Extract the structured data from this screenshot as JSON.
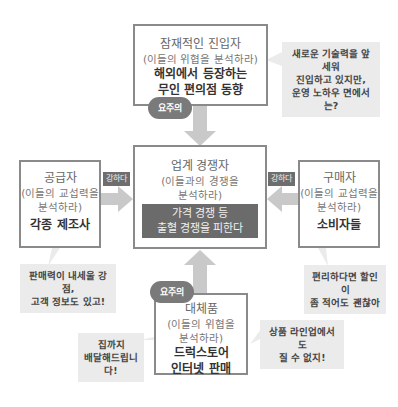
{
  "top": {
    "title": "잠재적인 진입자",
    "sub": "(이들의 위협을 분석하라)",
    "bold1": "해외에서 등장하는",
    "bold2": "무인 편의점 동향",
    "badge": "요주의",
    "bubble": [
      "새로운 기술력을 앞세워",
      "진입하고 있지만,",
      "운영 노하우 면에서는?"
    ]
  },
  "center": {
    "title": "업계 경쟁자",
    "sub1": "(이들과의 경쟁을",
    "sub2": "분석하라)",
    "dark1": "가격 경쟁 등",
    "dark2": "출혈 경쟁을 피한다"
  },
  "left": {
    "title": "공급자",
    "sub1": "(이들의 교섭력을",
    "sub2": "분석하라)",
    "bold": "각종 제조사",
    "tag": "강하다",
    "bubble": [
      "판매력이 내세울 강점,",
      "고객 정보도 있고!"
    ]
  },
  "right": {
    "title": "구매자",
    "sub1": "(이들의 교섭력을",
    "sub2": "분석하라)",
    "bold": "소비자들",
    "tag": "강하다",
    "bubble": [
      "편리하다면 할인이",
      "좀 적어도 괜찮아"
    ]
  },
  "bottom": {
    "title": "대체품",
    "sub1": "(이들의 위협을",
    "sub2": "분석하라)",
    "bold1": "드럭스토어",
    "bold2": "인터넷 판매",
    "badge": "요주의",
    "bubble_right": [
      "상품 라인업에서도",
      "질 수 없지!"
    ],
    "bubble_left": [
      "집까지",
      "배달해드립니다!"
    ]
  }
}
